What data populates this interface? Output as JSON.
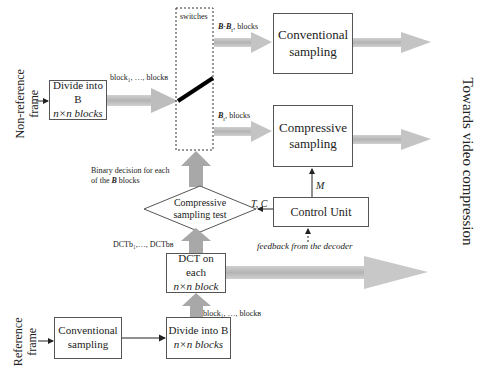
{
  "labels": {
    "non_reference_frame": [
      "Non-reference",
      "frame"
    ],
    "reference_frame": [
      "Reference",
      "frame"
    ],
    "towards_video_compression": "Towards video compression",
    "switches": "switches",
    "blocks_top": "block₁, …, blockʙ",
    "bb_blocks": "B-Bᵢ blocks",
    "bb_blocks_bold": "B-B",
    "bb_blocks_sub": "r",
    "bb_blocks_suffix": ", blocks",
    "br_blocks_bold": "B",
    "br_blocks_sub": "r",
    "br_blocks_suffix": ", blocks",
    "binary_decision_line1": "Binary decision for each",
    "binary_decision_line2_pre": "of the ",
    "binary_decision_line2_bold": "B",
    "binary_decision_line2_post": " blocks",
    "dct_list": "DCTb₁,…, DCTbʙ",
    "tc": "T, C",
    "m": "M",
    "feedback": "feedback from the decoder",
    "blocks_bottom": "block₁, …, blockʙ"
  },
  "boxes": {
    "divide_top": {
      "line1": "Divide into B",
      "line2": "n×n blocks"
    },
    "conventional_top": {
      "line1": "Conventional",
      "line2": "sampling"
    },
    "compressive": {
      "line1": "Compressive",
      "line2": "sampling"
    },
    "control_unit": {
      "line1": "Control Unit"
    },
    "cs_test": {
      "line1": "Compressive",
      "line2": "sampling test"
    },
    "dct": {
      "line1": "DCT on each",
      "line2": "n×n block"
    },
    "conventional_bottom": {
      "line1": "Conventional",
      "line2": "sampling"
    },
    "divide_bottom": {
      "line1": "Divide into B",
      "line2": "n×n blocks"
    }
  },
  "colors": {
    "fat_arrow": "#b8b8b8",
    "fat_arrow_dark": "#a0a0a0",
    "box_border": "#555555",
    "switch_bar": "#000000"
  }
}
